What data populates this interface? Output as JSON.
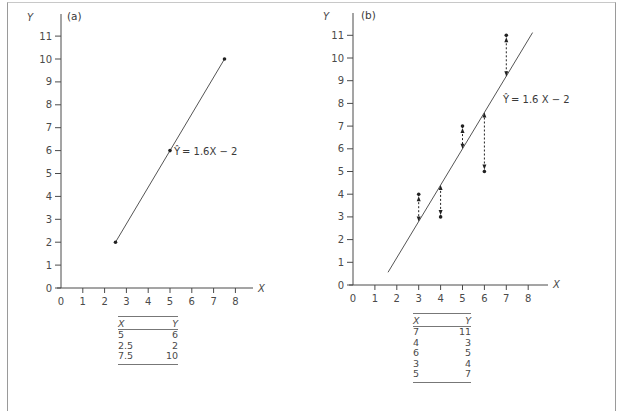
{
  "chart_data": [
    {
      "type": "line",
      "panel_label": "(a)",
      "title": "",
      "xlabel": "X",
      "ylabel": "Y",
      "xlim": [
        0,
        8
      ],
      "ylim": [
        0,
        11
      ],
      "x_ticks": [
        "0",
        "1",
        "2",
        "3",
        "4",
        "5",
        "6",
        "7",
        "8"
      ],
      "y_ticks": [
        "0",
        "1",
        "2",
        "3",
        "4",
        "5",
        "6",
        "7",
        "8",
        "9",
        "10",
        "11"
      ],
      "grid": false,
      "regression_line": {
        "equation": "Ŷ = 1.6X − 2",
        "slope": 1.6,
        "intercept": -2,
        "x_range": [
          2.5,
          7.5
        ]
      },
      "points": [
        {
          "x": 5,
          "y": 6
        },
        {
          "x": 2.5,
          "y": 2
        },
        {
          "x": 7.5,
          "y": 10
        }
      ],
      "table": {
        "headers": [
          "X",
          "Y"
        ],
        "rows": [
          [
            "5",
            "6"
          ],
          [
            "2.5",
            "2"
          ],
          [
            "7.5",
            "10"
          ]
        ]
      }
    },
    {
      "type": "scatter",
      "panel_label": "(b)",
      "title": "",
      "xlabel": "X",
      "ylabel": "Y",
      "xlim": [
        0,
        8
      ],
      "ylim": [
        0,
        11
      ],
      "x_ticks": [
        "0",
        "1",
        "2",
        "3",
        "4",
        "5",
        "6",
        "7",
        "8"
      ],
      "y_ticks": [
        "0",
        "1",
        "2",
        "3",
        "4",
        "5",
        "6",
        "7",
        "8",
        "9",
        "10",
        "11"
      ],
      "grid": false,
      "regression_line": {
        "equation": "Ŷ = 1.6X − 2",
        "slope": 1.6,
        "intercept": -2,
        "x_range": [
          1.6,
          8.2
        ]
      },
      "points": [
        {
          "x": 7,
          "y": 11
        },
        {
          "x": 4,
          "y": 3
        },
        {
          "x": 6,
          "y": 5
        },
        {
          "x": 3,
          "y": 4
        },
        {
          "x": 5,
          "y": 7
        }
      ],
      "residuals": [
        {
          "x": 7,
          "observed": 11,
          "predicted": 9.2
        },
        {
          "x": 4,
          "observed": 3,
          "predicted": 4.4
        },
        {
          "x": 6,
          "observed": 5,
          "predicted": 7.6
        },
        {
          "x": 3,
          "observed": 4,
          "predicted": 2.8
        },
        {
          "x": 5,
          "observed": 7,
          "predicted": 6.0
        }
      ],
      "table": {
        "headers": [
          "X",
          "Y"
        ],
        "rows": [
          [
            "7",
            "11"
          ],
          [
            "4",
            "3"
          ],
          [
            "6",
            "5"
          ],
          [
            "3",
            "4"
          ],
          [
            "5",
            "7"
          ]
        ]
      }
    }
  ],
  "labels": {
    "a": {
      "panel": "(a)",
      "x_axis": "X",
      "y_axis": "Y",
      "eq_hat": "Ŷ",
      "eq_rest": "= 1.6X − 2"
    },
    "b": {
      "panel": "(b)",
      "x_axis": "X",
      "y_axis": "Y",
      "eq_hat": "Ŷ",
      "eq_rest": "= 1.6 X − 2"
    }
  },
  "colors": {
    "axis": "#4a4a4a",
    "line": "#555555",
    "point": "#222222",
    "frame": "#9a9a9a"
  }
}
